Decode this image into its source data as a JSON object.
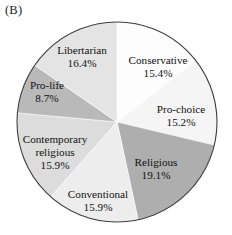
{
  "figure": {
    "panel_label": "(B)",
    "background_color": "#ffffff",
    "outline_color": "#3d3d3d"
  },
  "chart_data": {
    "type": "pie",
    "title": "",
    "subtitle": "",
    "xlabel": "",
    "ylabel": "",
    "legend": "none",
    "grid": false,
    "start_angle_deg": 0,
    "direction": "clockwise",
    "center": {
      "x": 117,
      "y": 122
    },
    "radius": 100,
    "labels": [
      "Conservative",
      "Pro-choice",
      "Religious",
      "Conventional",
      "Contemporary religious",
      "Pro-life",
      "Libertarian"
    ],
    "values": [
      15.4,
      15.2,
      19.1,
      15.9,
      15.9,
      8.7,
      16.4
    ],
    "value_labels": [
      "15.4%",
      "15.2%",
      "19.1%",
      "15.9%",
      "15.9%",
      "8.7%",
      "16.4%"
    ],
    "colors": [
      "#fdfdfd",
      "#f5f5f5",
      "#aeaeae",
      "#ededed",
      "#dcdcdc",
      "#b9b9b9",
      "#e4e4e4"
    ],
    "slices": [
      {
        "label": "Conservative",
        "value": 15.4,
        "value_label": "15.4%",
        "color": "#fdfdfd",
        "label_line1": "Conservative",
        "label_line2": "15.4%",
        "label_x": 158,
        "label_y": 64
      },
      {
        "label": "Pro-choice",
        "value": 15.2,
        "value_label": "15.2%",
        "color": "#f5f5f5",
        "label_line1": "Pro-choice",
        "label_line2": "15.2%",
        "label_x": 181,
        "label_y": 113
      },
      {
        "label": "Religious",
        "value": 19.1,
        "value_label": "19.1%",
        "color": "#aeaeae",
        "label_line1": "Religious",
        "label_line2": "19.1%",
        "label_x": 156,
        "label_y": 166
      },
      {
        "label": "Conventional",
        "value": 15.9,
        "value_label": "15.9%",
        "color": "#ededed",
        "label_line1": "Conventional",
        "label_line2": "15.9%",
        "label_x": 98,
        "label_y": 198
      },
      {
        "label": "Contemporary religious",
        "value": 15.9,
        "value_label": "15.9%",
        "color": "#dcdcdc",
        "label_line1": "Contemporary",
        "label_line2": "religious",
        "label_line3": "15.9%",
        "label_x": 55,
        "label_y": 143
      },
      {
        "label": "Pro-life",
        "value": 8.7,
        "value_label": "8.7%",
        "color": "#b9b9b9",
        "label_line1": "Pro-life",
        "label_line2": "8.7%",
        "label_x": 47,
        "label_y": 89
      },
      {
        "label": "Libertarian",
        "value": 16.4,
        "value_label": "16.4%",
        "color": "#e4e4e4",
        "label_line1": "Libertarian",
        "label_line2": "16.4%",
        "label_x": 82,
        "label_y": 54
      }
    ]
  }
}
